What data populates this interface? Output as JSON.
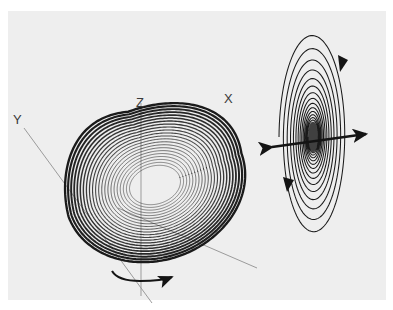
{
  "figure": {
    "background_color": "#ffffff",
    "scan_background_color": "#eeeeee",
    "ink_color": "#1a1a1a",
    "axis_color": "#9a9a9a",
    "scan": {
      "x": 8,
      "y": 11,
      "width": 378,
      "height": 289
    }
  },
  "axes": {
    "origin": {
      "x": 141,
      "y": 180
    },
    "labels": [
      {
        "name": "y-axis-label",
        "text": "Y",
        "x": 13,
        "y": 113
      },
      {
        "name": "z-axis-label",
        "text": "Z",
        "x": 136,
        "y": 96
      },
      {
        "name": "x-axis-label",
        "text": "X",
        "x": 224,
        "y": 92
      }
    ],
    "lines": [
      {
        "name": "z-axis-line",
        "x1": 141,
        "y1": 103,
        "x2": 141,
        "y2": 296
      },
      {
        "name": "y-axis-line",
        "x1": 24,
        "y1": 128,
        "x2": 152,
        "y2": 303
      },
      {
        "name": "x-axis-line",
        "x1": 118,
        "y1": 208,
        "x2": 257,
        "y2": 268
      }
    ]
  },
  "attractor": {
    "name": "roessler-attractor",
    "type": "chaotic-trajectory",
    "center": {
      "x": 155,
      "y": 185
    },
    "loop_count": 22,
    "extent": {
      "x_min": 62,
      "x_max": 248,
      "y_min": 95,
      "y_max": 268
    },
    "fold_region": {
      "x": 120,
      "y": 140
    }
  },
  "rotation_arrow": {
    "name": "attractor-rotation-arrow",
    "start": {
      "x": 112,
      "y": 272
    },
    "end": {
      "x": 176,
      "y": 277
    },
    "direction": "clockwise-right"
  },
  "spiral": {
    "name": "spiral-focus",
    "type": "nested-ellipses",
    "center": {
      "x": 313,
      "y": 137
    },
    "ring_count": 14,
    "outer_rx": 34,
    "outer_ry": 105,
    "extent": {
      "x_min": 283,
      "x_max": 350,
      "y_min": 18,
      "y_max": 228
    },
    "arrowheads": [
      {
        "name": "spiral-arrow-upper-right",
        "x": 343,
        "y": 63,
        "direction": "down"
      },
      {
        "name": "spiral-arrow-lower-left",
        "x": 288,
        "y": 184,
        "direction": "down"
      }
    ]
  },
  "spiral_axis_arrow": {
    "name": "spiral-unstable-manifold-arrow",
    "type": "double-headed",
    "left_tip": {
      "x": 267,
      "y": 148
    },
    "right_tip": {
      "x": 371,
      "y": 133
    }
  },
  "chart_data": {
    "type": "line",
    "xlabel": "X",
    "ylabel": "Y",
    "zlabel": "Z",
    "grid": false,
    "legend": null,
    "annotations": [
      "Y",
      "Z",
      "X"
    ],
    "series": [
      {
        "name": "attractor-trajectory",
        "description": "Rossler-type banded chaotic attractor, 22 nested loops with a fold",
        "loops": 22
      },
      {
        "name": "spiral-focus",
        "description": "Nested elliptical spiral converging to a dense focus point",
        "loops": 14
      }
    ]
  }
}
